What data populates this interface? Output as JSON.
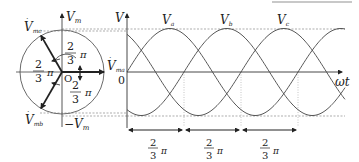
{
  "diagram": {
    "type": "three-phase phasor and waveform diagram",
    "phasor": {
      "origin_label": "O",
      "axis_top_label": "V",
      "axis_top_sub": "m",
      "axis_bottom_label": "−V",
      "axis_bottom_sub": "m",
      "phasors": [
        {
          "name": "V",
          "sub": "ma",
          "angle_deg": 0
        },
        {
          "name": "V",
          "sub": "mc",
          "angle_deg": 120
        },
        {
          "name": "V",
          "sub": "mb",
          "angle_deg": -120
        }
      ],
      "angle_labels": [
        {
          "num": "2",
          "den": "3",
          "sym": "π",
          "position": "upper"
        },
        {
          "num": "2",
          "den": "3",
          "sym": "π",
          "position": "left"
        },
        {
          "num": "2",
          "den": "3",
          "sym": "π",
          "position": "lower"
        }
      ]
    },
    "waveform": {
      "y_axis_label": "V",
      "x_axis_label": "ωt",
      "origin_label": "0",
      "curves": [
        {
          "label": "V",
          "sub": "a"
        },
        {
          "label": "V",
          "sub": "b"
        },
        {
          "label": "V",
          "sub": "c"
        }
      ],
      "intervals": [
        {
          "num": "2",
          "den": "3",
          "sym": "π"
        },
        {
          "num": "2",
          "den": "3",
          "sym": "π"
        },
        {
          "num": "2",
          "den": "3",
          "sym": "π"
        }
      ]
    },
    "colors": {
      "line": "#333333",
      "dashed": "#777777",
      "bar": "#c8c8c8"
    }
  }
}
